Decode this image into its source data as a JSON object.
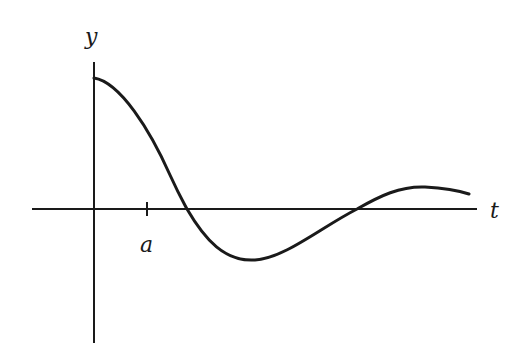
{
  "diagram": {
    "type": "damped oscillation curve",
    "axes": {
      "horizontal_label": "t",
      "vertical_label": "y",
      "tick_label": "a"
    },
    "colors": {
      "stroke": "#1a1a1a",
      "background": "#ffffff"
    },
    "geometry": {
      "origin": [
        94,
        209
      ],
      "h_axis": {
        "x1": 32,
        "x2": 477,
        "y": 209
      },
      "v_axis": {
        "x": 94,
        "y1": 62,
        "y2": 343
      },
      "tick": {
        "x": 147,
        "y1": 202,
        "y2": 216
      },
      "curve_points": [
        [
          94,
          78
        ],
        [
          120,
          96
        ],
        [
          150,
          140
        ],
        [
          187,
          209
        ],
        [
          215,
          245
        ],
        [
          255,
          260
        ],
        [
          300,
          245
        ],
        [
          357,
          209
        ],
        [
          390,
          193
        ],
        [
          425,
          188
        ],
        [
          469,
          194
        ]
      ]
    }
  }
}
